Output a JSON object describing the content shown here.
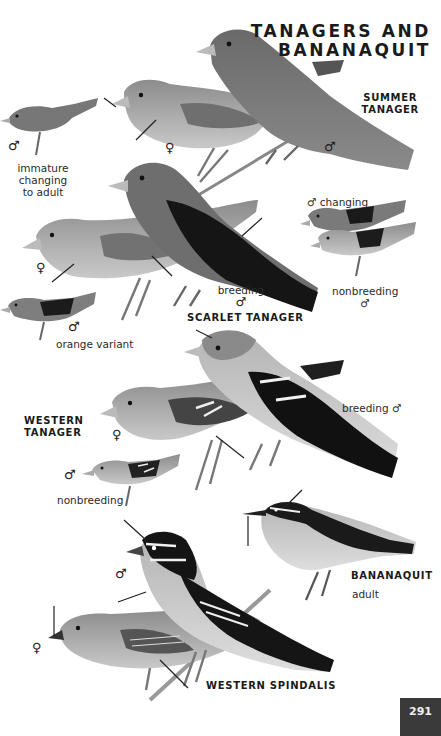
{
  "page": {
    "title_line1": "TANAGERS AND",
    "title_line2": "BANANAQUIT",
    "page_number": "291",
    "colors": {
      "background": "#ffffff",
      "text": "#1a1a1a",
      "page_tab": "#3a3a3a"
    }
  },
  "species": [
    {
      "name_line1": "SUMMER",
      "name_line2": "TANAGER",
      "figures": [
        {
          "sex": "♂",
          "note_lines": [
            "immature",
            "changing",
            "to adult"
          ]
        },
        {
          "sex": "♀",
          "note_lines": []
        },
        {
          "sex": "♂",
          "note_lines": []
        }
      ]
    },
    {
      "name": "SCARLET TANAGER",
      "figures": [
        {
          "sex": "♀",
          "note": ""
        },
        {
          "sex": "♂",
          "note": "breeding"
        },
        {
          "sex": "♂",
          "note": "changing"
        },
        {
          "sex": "♂",
          "note": "nonbreeding"
        },
        {
          "sex": "♂",
          "note": "orange variant"
        }
      ]
    },
    {
      "name_line1": "WESTERN",
      "name_line2": "TANAGER",
      "figures": [
        {
          "sex": "♀",
          "note": ""
        },
        {
          "sex": "♂",
          "note": "breeding"
        },
        {
          "sex": "♂",
          "note": "nonbreeding"
        }
      ]
    },
    {
      "name": "BANANAQUIT",
      "figures": [
        {
          "sex": "",
          "note": "adult"
        }
      ]
    },
    {
      "name": "WESTERN SPINDALIS",
      "figures": [
        {
          "sex": "♂",
          "note": ""
        },
        {
          "sex": "♀",
          "note": ""
        }
      ]
    }
  ],
  "symbols": {
    "male": "♂",
    "female": "♀"
  }
}
